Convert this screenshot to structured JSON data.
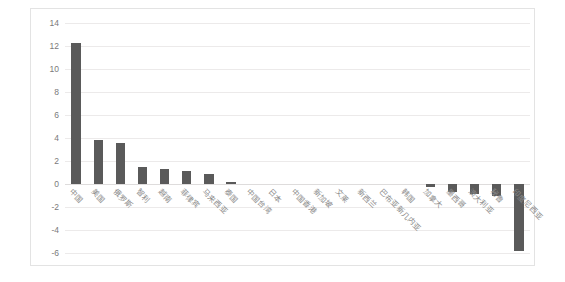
{
  "chart_data": {
    "type": "bar",
    "title": "",
    "subtitle": "",
    "xlabel": "",
    "ylabel": "",
    "ylim": [
      -6,
      14
    ],
    "ytick_step": 2,
    "yticks": [
      14,
      12,
      10,
      8,
      6,
      4,
      2,
      0,
      -2,
      -4,
      -6
    ],
    "grid": true,
    "legend": false,
    "legend_position": "none",
    "bar_color": "#5a5a5a",
    "categories": [
      "中国",
      "美国",
      "俄罗斯",
      "智利",
      "越南",
      "菲律宾",
      "马来西亚",
      "泰国",
      "中国台湾",
      "日本",
      "中国香港",
      "新加坡",
      "文莱",
      "新西兰",
      "巴布亚新几内亚",
      "韩国",
      "加拿大",
      "墨西哥",
      "澳大利亚",
      "秘鲁",
      "印度尼西亚"
    ],
    "values": [
      12.3,
      3.8,
      3.6,
      1.5,
      1.3,
      1.1,
      0.9,
      0.15,
      0.0,
      0.0,
      0.0,
      0.0,
      0.0,
      0.0,
      0.0,
      0.0,
      -0.3,
      -0.7,
      -0.9,
      -1.0,
      -5.8
    ]
  },
  "axis": {
    "y_labels": [
      "14",
      "12",
      "10",
      "8",
      "6",
      "4",
      "2",
      "0",
      "-2",
      "-4",
      "-6"
    ]
  }
}
